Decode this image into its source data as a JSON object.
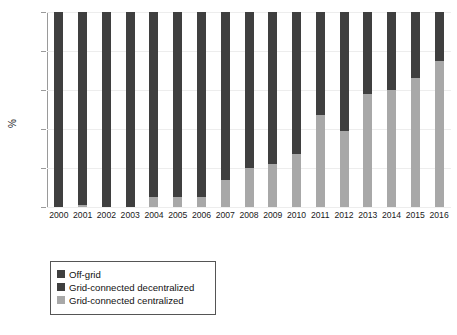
{
  "chart_data": {
    "type": "bar",
    "subtype": "stacked-percentage-column",
    "title": "",
    "xlabel": "",
    "ylabel": "%",
    "ylim": [
      0,
      100
    ],
    "yticks": [
      0,
      20,
      40,
      60,
      80,
      100
    ],
    "grid": true,
    "legend_position": "below-left",
    "categories": [
      "2000",
      "2001",
      "2002",
      "2003",
      "2004",
      "2005",
      "2006",
      "2007",
      "2008",
      "2009",
      "2010",
      "2011",
      "2012",
      "2013",
      "2014",
      "2015",
      "2016"
    ],
    "series": [
      {
        "name": "Grid-connected centralized",
        "color": "#a8a8a8",
        "values": [
          0,
          1,
          0,
          0,
          5,
          5,
          5,
          14,
          20,
          22,
          27,
          47,
          39,
          58,
          60,
          66,
          75
        ]
      },
      {
        "name": "Grid-connected decentralized",
        "color": "#3f3f3f",
        "values": [
          85,
          92,
          91,
          92,
          95,
          95,
          95,
          86,
          80,
          78,
          73,
          53,
          61,
          42,
          40,
          34,
          25
        ]
      },
      {
        "name": "Off-grid",
        "color": "#3f3f3f",
        "values": [
          15,
          7,
          9,
          8,
          0,
          0,
          0,
          0,
          0,
          0,
          0,
          0,
          0,
          0,
          0,
          0,
          0
        ]
      }
    ]
  },
  "axis": {
    "y_tick_labels": [
      "100",
      "80",
      "60",
      "40",
      "20",
      "0"
    ],
    "y_axis_title": "%",
    "x_tick_labels": [
      "2000",
      "2001",
      "2002",
      "2003",
      "2004",
      "2005",
      "2006",
      "2007",
      "2008",
      "2009",
      "2010",
      "2011",
      "2012",
      "2013",
      "2014",
      "2015",
      "2016"
    ]
  },
  "legend": {
    "items": [
      {
        "label": "Off-grid",
        "color": "#3f3f3f"
      },
      {
        "label": "Grid-connected decentralized",
        "color": "#3f3f3f"
      },
      {
        "label": "Grid-connected centralized",
        "color": "#a8a8a8"
      }
    ]
  },
  "colors": {
    "dark": "#3f3f3f",
    "light": "#a8a8a8",
    "axis": "#9a9a9a",
    "grid": "#ededed",
    "background": "#ffffff"
  }
}
